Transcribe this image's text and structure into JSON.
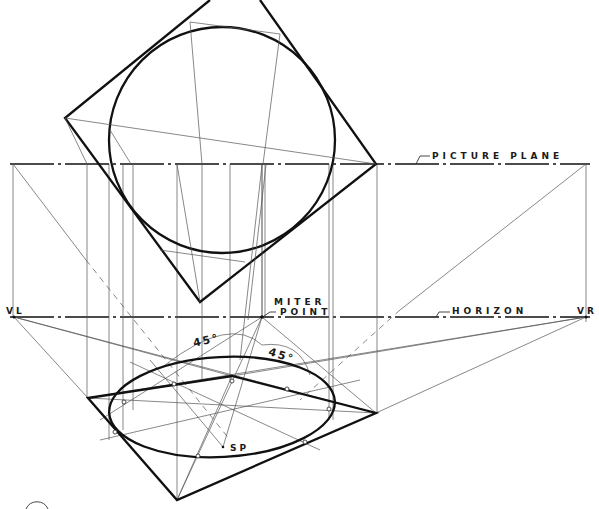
{
  "figure": {
    "type": "perspective construction drawing"
  },
  "labels": {
    "picture_plane": "PICTURE PLANE",
    "horizon": "HORIZON",
    "vanishing_left": "VL",
    "vanishing_right": "VR",
    "miter_line1": "MITER",
    "miter_line2": "POINT",
    "angle_left": "45°",
    "angle_right": "45°",
    "station_point": "SP"
  },
  "geometry": {
    "picture_plane_y": 164,
    "horizon_y": 317,
    "vl": [
      14,
      317
    ],
    "vr": [
      586,
      317
    ],
    "miter_point": [
      262,
      317
    ],
    "station_point": [
      223,
      447
    ],
    "plan_circle": {
      "cx": 222,
      "cy": 140,
      "r": 113
    },
    "plan_square": [
      [
        65,
        118
      ],
      [
        210,
        0
      ],
      [
        376,
        164
      ],
      [
        200,
        302
      ]
    ],
    "perspective_square": [
      [
        88,
        398
      ],
      [
        232,
        376
      ],
      [
        376,
        413
      ],
      [
        177,
        500
      ]
    ],
    "perspective_ellipse": {
      "cx": 222,
      "cy": 407,
      "rx": 113,
      "ry": 50
    }
  },
  "colors": {
    "ink": "#111111",
    "construction": "#555555",
    "paper": "#ffffff"
  }
}
